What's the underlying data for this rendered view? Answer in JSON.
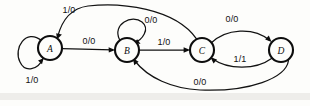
{
  "diagram": {
    "type": "finite-state-machine",
    "ink_color": "#0d0d0d",
    "background_color": "#fdfdfb",
    "states": [
      {
        "id": "A",
        "label": "A",
        "cx": 50,
        "cy": 48,
        "r": 12
      },
      {
        "id": "B",
        "label": "B",
        "cx": 127,
        "cy": 50,
        "r": 12
      },
      {
        "id": "C",
        "label": "C",
        "cx": 202,
        "cy": 50,
        "r": 12
      },
      {
        "id": "D",
        "label": "D",
        "cx": 281,
        "cy": 50,
        "r": 12
      }
    ],
    "transitions": [
      {
        "id": "a-self",
        "from": "A",
        "to": "A",
        "label": "1/0",
        "label_x": 32,
        "label_y": 80,
        "kind": "self-loop-left"
      },
      {
        "id": "a-b",
        "from": "A",
        "to": "B",
        "label": "0/0",
        "label_x": 89,
        "label_y": 41,
        "kind": "straight"
      },
      {
        "id": "b-self",
        "from": "B",
        "to": "B",
        "label": "0/0",
        "label_x": 151,
        "label_y": 20,
        "kind": "self-loop-top"
      },
      {
        "id": "b-c",
        "from": "B",
        "to": "C",
        "label": "1/0",
        "label_x": 164,
        "label_y": 42,
        "kind": "straight"
      },
      {
        "id": "c-a",
        "from": "C",
        "to": "A",
        "label": "1/0",
        "label_x": 69,
        "label_y": 10,
        "kind": "arc-top-long"
      },
      {
        "id": "c-d",
        "from": "C",
        "to": "D",
        "label": "0/0",
        "label_x": 232,
        "label_y": 19,
        "kind": "arc-upper"
      },
      {
        "id": "d-c",
        "from": "D",
        "to": "C",
        "label": "1/1",
        "label_x": 240,
        "label_y": 59,
        "kind": "arc-lower"
      },
      {
        "id": "d-b",
        "from": "D",
        "to": "B",
        "label": "0/0",
        "label_x": 200,
        "label_y": 82,
        "kind": "arc-bottom-long"
      }
    ]
  }
}
